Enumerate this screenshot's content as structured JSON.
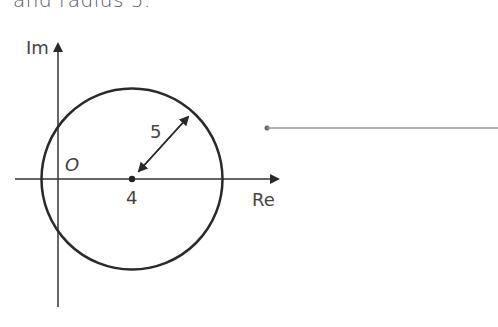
{
  "caption": "and radius 5.",
  "diagram": {
    "axes": {
      "imaginary_label": "Im",
      "real_label": "Re"
    },
    "origin_label": "O",
    "circle": {
      "center_label": "4",
      "radius_label": "5",
      "center": [
        4,
        0
      ],
      "radius": 5
    },
    "colors": {
      "stroke": "#2a2a2a",
      "line": "#888888"
    }
  }
}
